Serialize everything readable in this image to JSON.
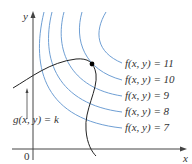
{
  "diagram": {
    "type": "level-curves-with-constraint",
    "axes": {
      "x_label": "x",
      "y_label": "y",
      "origin_label": "0"
    },
    "constraint_curve": {
      "label": "g(x, y) = k",
      "color": "#222222"
    },
    "level_curves": [
      {
        "label": "f(x, y) = 11",
        "value": 11
      },
      {
        "label": "f(x, y) = 10",
        "value": 10
      },
      {
        "label": "f(x, y) = 9",
        "value": 9
      },
      {
        "label": "f(x, y) = 8",
        "value": 8
      },
      {
        "label": "f(x, y) = 7",
        "value": 7
      }
    ],
    "level_curve_color": "#5b8fc9",
    "tangent_point": {
      "marker": "filled-dot"
    }
  }
}
